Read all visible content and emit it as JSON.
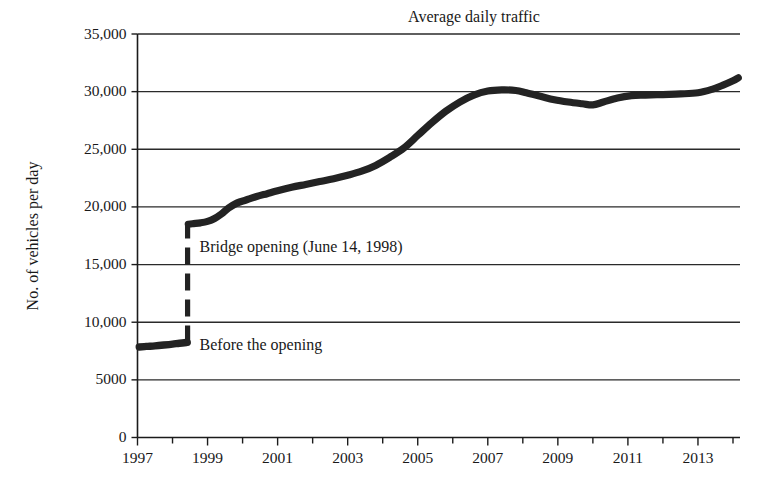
{
  "chart_data": {
    "type": "line",
    "title": "Average daily traffic",
    "xlabel": "",
    "ylabel": "No. of vehicles per day",
    "xlim": [
      1997,
      2014.2
    ],
    "ylim": [
      0,
      35000
    ],
    "grid": true,
    "legend_position": "none",
    "y_ticks": [
      0,
      5000,
      10000,
      15000,
      20000,
      25000,
      30000,
      35000
    ],
    "y_tick_labels": [
      "0",
      "5000",
      "10,000",
      "15,000",
      "20,000",
      "25,000",
      "30,000",
      "35,000"
    ],
    "x_ticks": [
      1997,
      1998,
      1999,
      2000,
      2001,
      2002,
      2003,
      2004,
      2005,
      2006,
      2007,
      2008,
      2009,
      2010,
      2011,
      2012,
      2013,
      2014
    ],
    "x_tick_labels": [
      "1997",
      "",
      "1999",
      "",
      "2001",
      "",
      "2003",
      "",
      "2005",
      "",
      "2007",
      "",
      "2009",
      "",
      "2011",
      "",
      "2013",
      ""
    ],
    "series": [
      {
        "name": "Before the opening",
        "x": [
          1997.05,
          1997.25,
          1997.5,
          1997.75,
          1998.0,
          1998.2,
          1998.42
        ],
        "values": [
          7850,
          7900,
          7950,
          8020,
          8100,
          8180,
          8250
        ]
      },
      {
        "name": "After the opening",
        "x": [
          1998.45,
          1998.6,
          1998.8,
          1999.0,
          1999.2,
          1999.4,
          1999.6,
          1999.85,
          2000.1,
          2000.4,
          2000.7,
          2001.0,
          2001.4,
          2001.8,
          2002.2,
          2002.6,
          2003.0,
          2003.4,
          2003.8,
          2004.2,
          2004.6,
          2005.0,
          2005.4,
          2005.8,
          2006.2,
          2006.6,
          2007.0,
          2007.4,
          2007.8,
          2008.1,
          2008.5,
          2008.9,
          2009.3,
          2009.7,
          2010.0,
          2010.3,
          2010.7,
          2011.1,
          2011.5,
          2012.0,
          2012.5,
          2013.0,
          2013.4,
          2013.7,
          2014.0,
          2014.15
        ],
        "values": [
          18500,
          18550,
          18620,
          18750,
          19000,
          19400,
          19900,
          20350,
          20600,
          20900,
          21150,
          21400,
          21700,
          21950,
          22200,
          22450,
          22750,
          23100,
          23600,
          24300,
          25100,
          26200,
          27300,
          28300,
          29100,
          29700,
          30050,
          30150,
          30100,
          29900,
          29600,
          29300,
          29100,
          28950,
          28850,
          29100,
          29450,
          29650,
          29700,
          29750,
          29800,
          29900,
          30200,
          30550,
          30950,
          31200
        ]
      }
    ],
    "opening_marker": {
      "year": 1998.43,
      "y_from": 8250,
      "y_to": 18500,
      "style": "dashed-vertical"
    },
    "annotations": [
      {
        "text": "Bridge opening (June 14, 1998)",
        "x": 1998.6,
        "y": 16500
      },
      {
        "text": "Before the opening",
        "x": 1998.6,
        "y": 8000
      }
    ]
  },
  "colors": {
    "line": "#232323",
    "grid": "#2a2a2a",
    "axis": "#1b1b1b",
    "text": "#191919",
    "background": "#ffffff"
  }
}
